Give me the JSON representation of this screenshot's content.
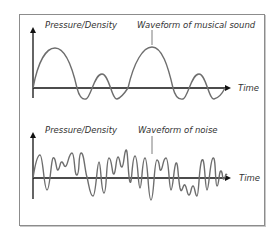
{
  "panels": [
    {
      "id": "musical",
      "y_axis_label": "Pressure/Density",
      "x_axis_label": "Time",
      "waveform_label": "Waveform of musical sound"
    },
    {
      "id": "noise",
      "y_axis_label": "Pressure/Density",
      "x_axis_label": "Time",
      "waveform_label": "Waveform of noise"
    }
  ],
  "colors": {
    "axis": "#111111",
    "wave": "#6e6e6e",
    "border": "#8c8c8c",
    "text": "#333333"
  }
}
